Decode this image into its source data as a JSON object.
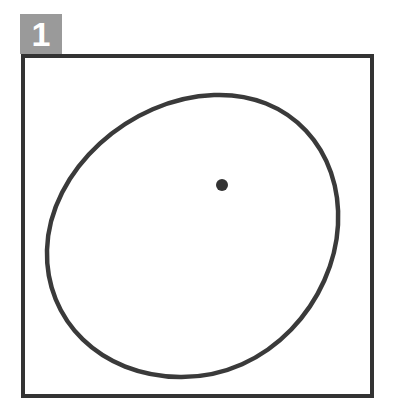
{
  "figure": {
    "step_number": "1",
    "badge_color": "#9a9a9a",
    "frame_color": "#333333",
    "stroke_color": "#3a3a3a"
  },
  "shapes": {
    "ellipse": {
      "description": "hand-drawn oval",
      "left": 47,
      "right": 338,
      "top": 95,
      "bottom": 377
    },
    "dot": {
      "description": "center point",
      "cx": 222,
      "cy": 185,
      "r": 6
    }
  }
}
